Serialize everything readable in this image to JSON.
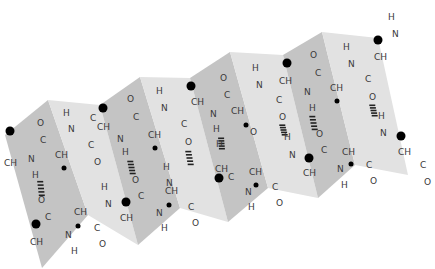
{
  "diagram": {
    "colors": {
      "panel_dark": "#c4c4c4",
      "panel_light": "#e2e2e2",
      "text": "#3a3a3a",
      "side_chain": "#000000"
    },
    "panels": [
      {
        "points": "5,135 48,100 88,215 42,268",
        "shade": "dark"
      },
      {
        "points": "48,100 100,105 138,245 88,215",
        "shade": "light"
      },
      {
        "points": "100,105 140,77 180,208 138,245",
        "shade": "dark"
      },
      {
        "points": "140,77 190,78 228,222 180,208",
        "shade": "light"
      },
      {
        "points": "190,78 230,52 268,188 228,222",
        "shade": "dark"
      },
      {
        "points": "230,52 283,55 318,198 268,188",
        "shade": "light"
      },
      {
        "points": "283,55 322,32 355,165 318,198",
        "shade": "dark"
      },
      {
        "points": "322,32 378,38 408,175 355,165",
        "shade": "light"
      }
    ],
    "atoms": [
      {
        "t": "CH",
        "x": 4,
        "y": 166
      },
      {
        "t": "O",
        "x": 37,
        "y": 126
      },
      {
        "t": "C",
        "x": 40,
        "y": 143
      },
      {
        "t": "N",
        "x": 28,
        "y": 162
      },
      {
        "t": "H",
        "x": 32,
        "y": 178
      },
      {
        "t": "CH",
        "x": 55,
        "y": 158
      },
      {
        "t": "H",
        "x": 63,
        "y": 116
      },
      {
        "t": "N",
        "x": 68,
        "y": 132
      },
      {
        "t": "C",
        "x": 88,
        "y": 148
      },
      {
        "t": "O",
        "x": 94,
        "y": 165
      },
      {
        "t": "CH",
        "x": 97,
        "y": 130
      },
      {
        "t": "C",
        "x": 90,
        "y": 121
      },
      {
        "t": "O",
        "x": 127,
        "y": 102
      },
      {
        "t": "C",
        "x": 133,
        "y": 120
      },
      {
        "t": "N",
        "x": 117,
        "y": 142
      },
      {
        "t": "CH",
        "x": 148,
        "y": 138
      },
      {
        "t": "H",
        "x": 156,
        "y": 94
      },
      {
        "t": "N",
        "x": 161,
        "y": 111
      },
      {
        "t": "C",
        "x": 181,
        "y": 127
      },
      {
        "t": "O",
        "x": 185,
        "y": 145
      },
      {
        "t": "H",
        "x": 122,
        "y": 155
      },
      {
        "t": "CH",
        "x": 191,
        "y": 105
      },
      {
        "t": "H",
        "x": 252,
        "y": 71
      },
      {
        "t": "N",
        "x": 256,
        "y": 88
      },
      {
        "t": "C",
        "x": 276,
        "y": 103
      },
      {
        "t": "O",
        "x": 279,
        "y": 120
      },
      {
        "t": "CH",
        "x": 279,
        "y": 84
      },
      {
        "t": "O",
        "x": 220,
        "y": 81
      },
      {
        "t": "C",
        "x": 224,
        "y": 98
      },
      {
        "t": "N",
        "x": 210,
        "y": 117
      },
      {
        "t": "CH",
        "x": 231,
        "y": 114
      },
      {
        "t": "H",
        "x": 213,
        "y": 132
      },
      {
        "t": "O",
        "x": 310,
        "y": 58
      },
      {
        "t": "C",
        "x": 315,
        "y": 76
      },
      {
        "t": "N",
        "x": 304,
        "y": 95
      },
      {
        "t": "CH",
        "x": 330,
        "y": 91
      },
      {
        "t": "H",
        "x": 309,
        "y": 111
      },
      {
        "t": "H",
        "x": 343,
        "y": 50
      },
      {
        "t": "N",
        "x": 348,
        "y": 67
      },
      {
        "t": "C",
        "x": 365,
        "y": 82
      },
      {
        "t": "O",
        "x": 369,
        "y": 100
      },
      {
        "t": "CH",
        "x": 374,
        "y": 60
      },
      {
        "t": "H",
        "x": 388,
        "y": 20
      },
      {
        "t": "N",
        "x": 392,
        "y": 37
      },
      {
        "t": "H",
        "x": 378,
        "y": 119
      },
      {
        "t": "N",
        "x": 380,
        "y": 136
      },
      {
        "t": "CH",
        "x": 398,
        "y": 155
      },
      {
        "t": "C",
        "x": 420,
        "y": 168
      },
      {
        "t": "O",
        "x": 424,
        "y": 185
      },
      {
        "t": "O",
        "x": 38,
        "y": 203
      },
      {
        "t": "C",
        "x": 45,
        "y": 220
      },
      {
        "t": "CH",
        "x": 30,
        "y": 245
      },
      {
        "t": "N",
        "x": 65,
        "y": 238
      },
      {
        "t": "H",
        "x": 71,
        "y": 254
      },
      {
        "t": "CH",
        "x": 74,
        "y": 215
      },
      {
        "t": "C",
        "x": 94,
        "y": 231
      },
      {
        "t": "O",
        "x": 99,
        "y": 247
      },
      {
        "t": "H",
        "x": 101,
        "y": 190
      },
      {
        "t": "N",
        "x": 105,
        "y": 207
      },
      {
        "t": "CH",
        "x": 120,
        "y": 221
      },
      {
        "t": "O",
        "x": 132,
        "y": 183
      },
      {
        "t": "C",
        "x": 138,
        "y": 199
      },
      {
        "t": "N",
        "x": 156,
        "y": 216
      },
      {
        "t": "H",
        "x": 161,
        "y": 231
      },
      {
        "t": "CH",
        "x": 165,
        "y": 194
      },
      {
        "t": "C",
        "x": 188,
        "y": 210
      },
      {
        "t": "O",
        "x": 192,
        "y": 226
      },
      {
        "t": "H",
        "x": 163,
        "y": 170
      },
      {
        "t": "N",
        "x": 166,
        "y": 186
      },
      {
        "t": "CH",
        "x": 215,
        "y": 172
      },
      {
        "t": "C",
        "x": 228,
        "y": 180
      },
      {
        "t": "N",
        "x": 245,
        "y": 195
      },
      {
        "t": "H",
        "x": 248,
        "y": 210
      },
      {
        "t": "CH",
        "x": 249,
        "y": 175
      },
      {
        "t": "C",
        "x": 272,
        "y": 190
      },
      {
        "t": "O",
        "x": 276,
        "y": 206
      },
      {
        "t": "H",
        "x": 284,
        "y": 140
      },
      {
        "t": "N",
        "x": 289,
        "y": 158
      },
      {
        "t": "CH",
        "x": 303,
        "y": 176
      },
      {
        "t": "O",
        "x": 316,
        "y": 137
      },
      {
        "t": "C",
        "x": 321,
        "y": 153
      },
      {
        "t": "N",
        "x": 337,
        "y": 172
      },
      {
        "t": "H",
        "x": 341,
        "y": 188
      },
      {
        "t": "CH",
        "x": 342,
        "y": 155
      },
      {
        "t": "C",
        "x": 366,
        "y": 168
      },
      {
        "t": "O",
        "x": 370,
        "y": 184
      },
      {
        "t": "O",
        "x": 250,
        "y": 135
      },
      {
        "t": "H",
        "x": 216,
        "y": 147
      }
    ],
    "side_chains": [
      {
        "x": 10,
        "y": 131,
        "r": 4.5
      },
      {
        "x": 103,
        "y": 108,
        "r": 4.5
      },
      {
        "x": 191,
        "y": 86,
        "r": 4.5
      },
      {
        "x": 287,
        "y": 63,
        "r": 4.5
      },
      {
        "x": 378,
        "y": 40,
        "r": 4.5
      },
      {
        "x": 401,
        "y": 136,
        "r": 4.5
      },
      {
        "x": 36,
        "y": 224,
        "r": 4.5
      },
      {
        "x": 126,
        "y": 202,
        "r": 4.5
      },
      {
        "x": 219,
        "y": 178,
        "r": 4.5
      },
      {
        "x": 309,
        "y": 158,
        "r": 4.5
      },
      {
        "x": 64,
        "y": 168,
        "r": 2.5
      },
      {
        "x": 155,
        "y": 148,
        "r": 2.5
      },
      {
        "x": 246,
        "y": 125,
        "r": 2.5
      },
      {
        "x": 337,
        "y": 101,
        "r": 2.5
      },
      {
        "x": 78,
        "y": 226,
        "r": 2.5
      },
      {
        "x": 169,
        "y": 205,
        "r": 2.5
      },
      {
        "x": 256,
        "y": 185,
        "r": 2.5
      },
      {
        "x": 351,
        "y": 164,
        "r": 2.5
      }
    ],
    "hydrogen_bonds": [
      {
        "x1": 40,
        "y1": 180,
        "x2": 42,
        "y2": 197
      },
      {
        "x1": 130,
        "y1": 160,
        "x2": 133,
        "y2": 175
      },
      {
        "x1": 188,
        "y1": 150,
        "x2": 191,
        "y2": 166
      },
      {
        "x1": 221,
        "y1": 137,
        "x2": 222,
        "y2": 150
      },
      {
        "x1": 282,
        "y1": 124,
        "x2": 285,
        "y2": 136
      },
      {
        "x1": 312,
        "y1": 115,
        "x2": 315,
        "y2": 131
      },
      {
        "x1": 372,
        "y1": 104,
        "x2": 375,
        "y2": 117
      }
    ]
  }
}
